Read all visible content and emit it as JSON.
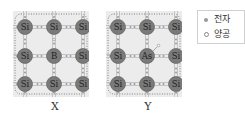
{
  "figure": {
    "panels": [
      {
        "id": "X",
        "label": "X",
        "dopant": "B",
        "atoms": [
          [
            "Si",
            "Si",
            "Si"
          ],
          [
            "Si",
            "B",
            "Si"
          ],
          [
            "Si",
            "Si",
            "Si"
          ]
        ],
        "extra_carrier": "hole"
      },
      {
        "id": "Y",
        "label": "Y",
        "dopant": "As",
        "atoms": [
          [
            "Si",
            "Si",
            "Si"
          ],
          [
            "Si",
            "As",
            "Si"
          ],
          [
            "Si",
            "Si",
            "Si"
          ]
        ],
        "extra_carrier": "electron"
      }
    ],
    "legend": {
      "items": [
        {
          "symbol": "filled-dot",
          "label": "전자"
        },
        {
          "symbol": "open-circle",
          "label": "양공"
        }
      ]
    },
    "colors": {
      "atom": "#7a7a7a",
      "panel_bg": "#ececec",
      "bond": "#bbbbbb",
      "electron": "#999999"
    }
  }
}
